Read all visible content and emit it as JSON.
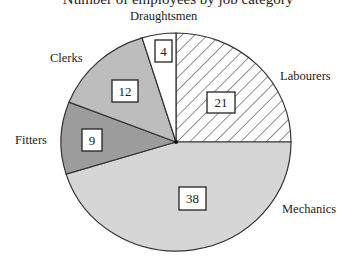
{
  "header": {
    "title_partial": "Number of employees by job category"
  },
  "chart_data": {
    "type": "pie",
    "title": "",
    "total": 84,
    "start_angle_deg": 0,
    "direction": "clockwise",
    "slices": [
      {
        "label": "Labourers",
        "value": 21,
        "fill": "hatch",
        "color": "#ffffff"
      },
      {
        "label": "Mechanics",
        "value": 38,
        "fill": "solid",
        "color": "#d6d6d6"
      },
      {
        "label": "Fitters",
        "value": 9,
        "fill": "solid",
        "color": "#9c9c9c"
      },
      {
        "label": "Clerks",
        "value": 12,
        "fill": "solid",
        "color": "#bdbdbd"
      },
      {
        "label": "Draughtsmen",
        "value": 4,
        "fill": "solid",
        "color": "#ffffff"
      }
    ],
    "value_labels": [
      "21",
      "38",
      "9",
      "12",
      "4"
    ],
    "legend": "none (category names placed outside slices)"
  }
}
